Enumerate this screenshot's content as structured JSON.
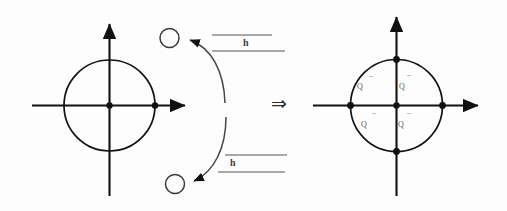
{
  "figure": {
    "type": "math-diagram",
    "title": "",
    "background_color": "#fdfdfd",
    "stroke_color": "#1a1a1a",
    "label_color": "#4a4a4a",
    "implication_symbol": "⇒"
  },
  "left_panel": {
    "name": "before-transformation",
    "axes": {
      "x_axis_label": "",
      "y_axis_label": "",
      "origin_marker": "filled-dot"
    },
    "circle": {
      "center": [
        0,
        0
      ],
      "radius": 1,
      "fill": "none",
      "stroke": "#1a1a1a"
    },
    "marked_points": [
      {
        "name": "origin",
        "style": "filled",
        "position": [
          0,
          0
        ]
      },
      {
        "name": "right-intersection",
        "style": "filled",
        "position": [
          1,
          0
        ]
      }
    ],
    "floating_circles": [
      {
        "name": "upper-open-circle",
        "style": "open"
      },
      {
        "name": "lower-open-circle",
        "style": "open"
      }
    ],
    "arrows": [
      {
        "name": "upper-curved-arrow",
        "direction": "to-upper-circle"
      },
      {
        "name": "lower-curved-arrow",
        "direction": "to-lower-circle"
      }
    ]
  },
  "operators": {
    "upper_label": "h",
    "lower_label": "h",
    "upper_overline": "—",
    "lower_overline": "—",
    "upper_underline": "—",
    "lower_underline": "—"
  },
  "right_panel": {
    "name": "after-transformation",
    "axes": {
      "x_axis_label": "",
      "y_axis_label": "",
      "origin_marker": "filled-dot"
    },
    "circle": {
      "center": [
        0,
        0
      ],
      "radius": 1,
      "fill": "none",
      "stroke": "#1a1a1a"
    },
    "marked_points": [
      {
        "name": "origin",
        "style": "filled",
        "position": [
          0,
          0
        ]
      },
      {
        "name": "right-intersection",
        "style": "filled",
        "position": [
          1,
          0
        ]
      },
      {
        "name": "left-intersection",
        "style": "filled",
        "position": [
          -1,
          0
        ]
      },
      {
        "name": "top-intersection",
        "style": "filled",
        "position": [
          0,
          1
        ]
      },
      {
        "name": "bottom-intersection",
        "style": "filled",
        "position": [
          0,
          -1
        ]
      }
    ],
    "quadrant_labels": [
      {
        "name": "quadrant-2-label",
        "text": "Q",
        "bar": "–",
        "quadrant": "upper-left"
      },
      {
        "name": "quadrant-1-label",
        "text": "Q",
        "bar": "–",
        "quadrant": "upper-right"
      },
      {
        "name": "quadrant-3-label",
        "text": "Q",
        "bar": "–",
        "quadrant": "lower-left"
      },
      {
        "name": "quadrant-4-label",
        "text": "Q",
        "bar": "–",
        "quadrant": "lower-right"
      }
    ]
  }
}
